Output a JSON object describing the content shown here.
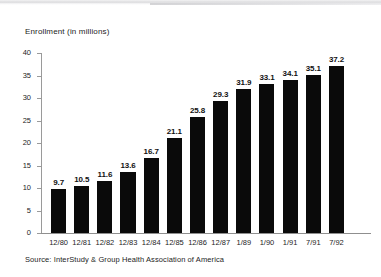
{
  "chart_data": {
    "type": "bar",
    "title": "Enrollment (in millions)",
    "xlabel": "",
    "ylabel": "",
    "ylim": [
      0,
      40
    ],
    "yticks": [
      0,
      5,
      10,
      15,
      20,
      25,
      30,
      35,
      40
    ],
    "grid": false,
    "legend": "none",
    "bar_color": "#0a0a0a",
    "categories": [
      "12/80",
      "12/81",
      "12/82",
      "12/83",
      "12/84",
      "12/85",
      "12/86",
      "12/87",
      "1/89",
      "1/90",
      "1/91",
      "7/91",
      "7/92"
    ],
    "values": [
      9.7,
      10.5,
      11.6,
      13.6,
      16.7,
      21.1,
      25.8,
      29.3,
      31.9,
      33.1,
      34.1,
      35.1,
      37.2
    ],
    "value_labels": [
      "9.7",
      "10.5",
      "11.6",
      "13.6",
      "16.7",
      "21.1",
      "25.8",
      "29.3",
      "31.9",
      "33.1",
      "34.1",
      "35.1",
      "37.2"
    ],
    "ytick_labels": [
      "0",
      "5",
      "10",
      "15",
      "20",
      "25",
      "30",
      "35",
      "40"
    ]
  },
  "source": {
    "text": "Source: InterStudy & Group Health Association of America"
  }
}
